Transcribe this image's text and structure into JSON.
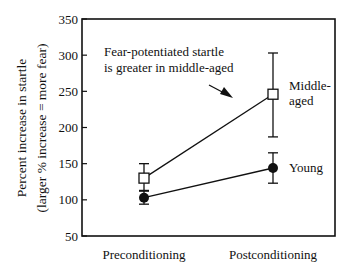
{
  "chart_data": {
    "type": "line",
    "title": "",
    "xlabel": "",
    "ylabel": "Percent increase in startle",
    "ylabel_sub": "(larger % increase = more fear)",
    "ylim": [
      50,
      350
    ],
    "yticks": [
      50,
      100,
      150,
      200,
      250,
      300,
      350
    ],
    "categories": [
      "Preconditioning",
      "Postconditioning"
    ],
    "grid": false,
    "series": [
      {
        "name": "Middle-aged",
        "label_lines": [
          "Middle-",
          "aged"
        ],
        "marker": "open-square",
        "values": [
          130,
          246
        ],
        "error_low": [
          112,
          187
        ],
        "error_high": [
          150,
          303
        ]
      },
      {
        "name": "Young",
        "label_lines": [
          "Young"
        ],
        "marker": "filled-circle",
        "values": [
          103,
          144
        ],
        "error_low": [
          94,
          123
        ],
        "error_high": [
          113,
          165
        ]
      }
    ],
    "annotation": {
      "lines": [
        "Fear-potentiated startle",
        "is greater in middle-aged"
      ],
      "arrow": true
    }
  }
}
